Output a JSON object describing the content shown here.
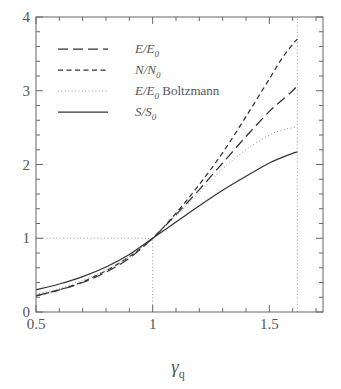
{
  "figure": {
    "background_color": "#ffffff",
    "axis_color": "#666666",
    "curve_color": "#333333",
    "guide_color": "#999999"
  },
  "axes": {
    "x": {
      "label_parts": {
        "base": "γ",
        "subscript": "q"
      },
      "min": 0.5,
      "max": 1.73,
      "major_ticks": [
        0.5,
        1,
        1.5
      ],
      "major_tick_labels": [
        "0.5",
        "1",
        "1.5"
      ],
      "minor_tick_step": 0.1
    },
    "y": {
      "label": "",
      "min": 0,
      "max": 4,
      "major_ticks": [
        0,
        1,
        2,
        3,
        4
      ],
      "major_tick_labels": [
        "0",
        "1",
        "2",
        "3",
        "4"
      ],
      "minor_tick_step": 0.2
    },
    "grid": false,
    "frame": true
  },
  "guides": {
    "vertical_dotted_x": 1.62,
    "vertical_dotted_x_small": 1.0,
    "horizontal_dotted_y": 1.0,
    "description": "dotted reference lines at gamma_q = 1 (to y=1), y = 1 (to x=1), and gamma_q = 1.62 full height"
  },
  "legend": {
    "position": "upper-left-inside",
    "entries": [
      {
        "label_numerator": "E",
        "label_denominator": "E",
        "label_sub": "0",
        "suffix": "",
        "style": "long-dash",
        "name": "legend-entry-energy"
      },
      {
        "label_numerator": "N",
        "label_denominator": "N",
        "label_sub": "0",
        "suffix": "",
        "style": "dashed",
        "name": "legend-entry-number"
      },
      {
        "label_numerator": "E",
        "label_denominator": "E",
        "label_sub": "0",
        "suffix": "Boltzmann",
        "style": "dotted",
        "name": "legend-entry-boltzmann"
      },
      {
        "label_numerator": "S",
        "label_denominator": "S",
        "label_sub": "0",
        "suffix": "",
        "style": "solid",
        "name": "legend-entry-entropy"
      }
    ]
  },
  "chart_data": {
    "type": "line",
    "title": "",
    "xlabel": "γ_q",
    "ylabel": "",
    "xlim": [
      0.5,
      1.73
    ],
    "ylim": [
      0,
      4
    ],
    "grid": false,
    "legend_position": "upper left",
    "x": [
      0.5,
      0.6,
      0.7,
      0.8,
      0.9,
      1.0,
      1.1,
      1.2,
      1.3,
      1.4,
      1.5,
      1.55,
      1.6,
      1.62
    ],
    "series": [
      {
        "name": "E/E_0",
        "style": "long-dash",
        "values": [
          0.22,
          0.3,
          0.4,
          0.54,
          0.73,
          1.0,
          1.32,
          1.66,
          2.02,
          2.38,
          2.72,
          2.86,
          3.0,
          3.07
        ]
      },
      {
        "name": "N/N_0",
        "style": "dashed",
        "values": [
          0.22,
          0.3,
          0.41,
          0.56,
          0.75,
          1.0,
          1.34,
          1.73,
          2.16,
          2.65,
          3.16,
          3.42,
          3.63,
          3.7
        ]
      },
      {
        "name": "E/E_0 Boltzmann",
        "style": "dotted",
        "values": [
          0.24,
          0.32,
          0.43,
          0.57,
          0.75,
          1.0,
          1.3,
          1.62,
          1.94,
          2.2,
          2.4,
          2.46,
          2.5,
          2.51
        ]
      },
      {
        "name": "S/S_0",
        "style": "solid",
        "values": [
          0.3,
          0.38,
          0.48,
          0.61,
          0.78,
          1.0,
          1.22,
          1.44,
          1.65,
          1.84,
          2.02,
          2.09,
          2.15,
          2.17
        ]
      }
    ]
  }
}
